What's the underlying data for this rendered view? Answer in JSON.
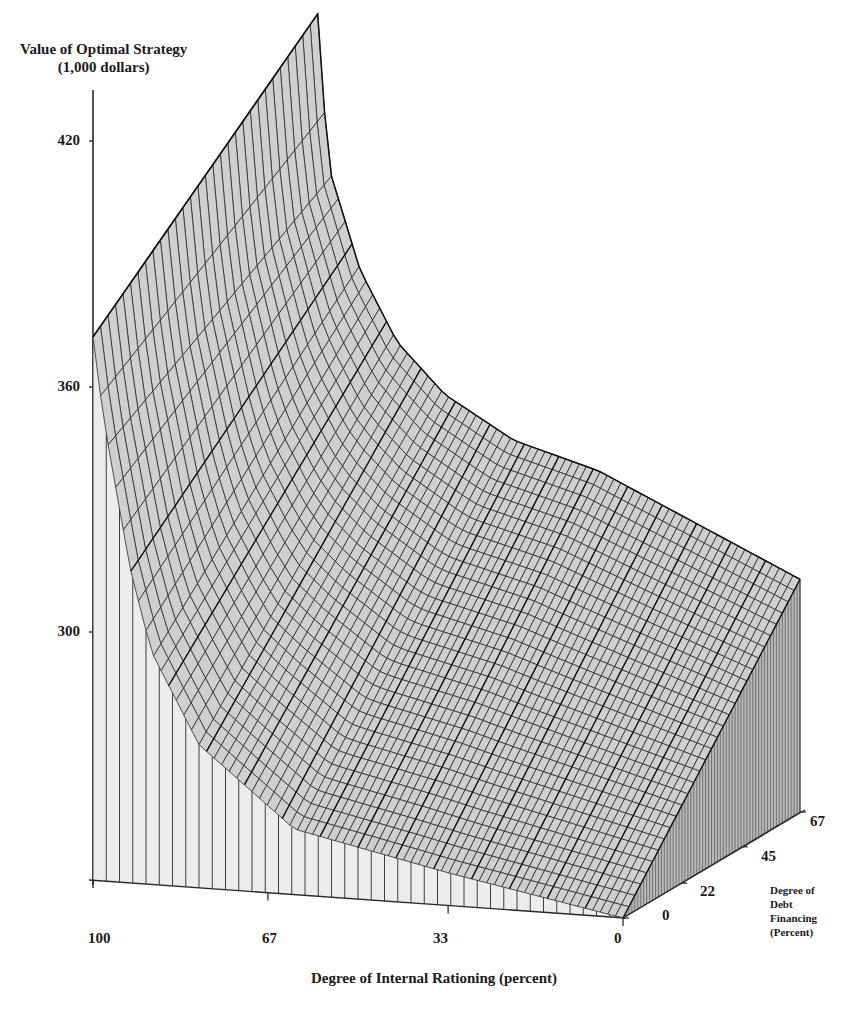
{
  "chart_data": {
    "type": "surface3d",
    "title": "",
    "zlabel_line1": "Value of Optimal Strategy",
    "zlabel_line2": "(1,000 dollars)",
    "xlabel": "Degree of Internal Rationing (percent)",
    "ylabel_lines": [
      "Degree of",
      "Debt",
      "Financing",
      "(Percent)"
    ],
    "z_ticks": [
      "420",
      "360",
      "300"
    ],
    "z_tick_values": [
      420,
      360,
      300
    ],
    "x_ticks": [
      "100",
      "67",
      "33",
      "0"
    ],
    "x_tick_values": [
      100,
      67,
      33,
      0
    ],
    "y_ticks": [
      "0",
      "22",
      "45",
      "67"
    ],
    "y_tick_values": [
      0,
      22,
      45,
      67
    ],
    "zlim": [
      240,
      432
    ],
    "xlim": [
      100,
      0
    ],
    "ylim": [
      0,
      67
    ],
    "profiles": {
      "debt_0": {
        "internal_rationing": [
          100,
          98,
          93,
          89,
          80,
          62,
          33,
          0
        ],
        "value": [
          373,
          353,
          317,
          297,
          275,
          256,
          248,
          240
        ]
      },
      "debt_67": {
        "internal_rationing": [
          91,
          89,
          83,
          76,
          67,
          54,
          38,
          0
        ],
        "value": [
          427,
          390,
          365,
          348,
          336,
          326,
          320,
          297
        ]
      }
    }
  },
  "colors": {
    "ink": "#2a2a2a",
    "surface_fill": "#cfcfcf",
    "front_wall_fill": "#ececec",
    "side_wall_fill": "#b8b8b8"
  }
}
